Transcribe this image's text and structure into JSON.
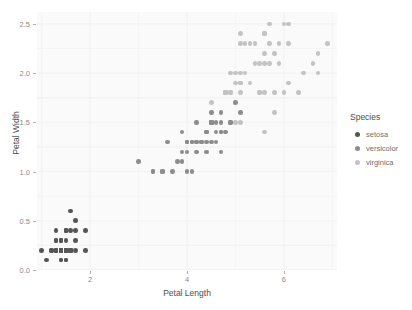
{
  "chart_data": {
    "type": "scatter",
    "title": "",
    "xlabel": "Petal Length",
    "ylabel": "Petal Width",
    "xlim": [
      0.905,
      7.095
    ],
    "ylim": [
      0.0,
      2.62
    ],
    "xticks": [
      2,
      4,
      6
    ],
    "xtick_labels": [
      "2",
      "4",
      "6"
    ],
    "yticks": [
      0.0,
      0.5,
      1.0,
      1.5,
      2.0,
      2.5
    ],
    "ytick_labels": [
      "0.0",
      "0.5",
      "1.0",
      "1.5",
      "2.0",
      "2.5"
    ],
    "grid": true,
    "legend": {
      "title": "Species",
      "position": "right",
      "entries": [
        {
          "name": "setosa",
          "color": "#555555"
        },
        {
          "name": "versicolor",
          "color": "#8c8c8c"
        },
        {
          "name": "virginica",
          "color": "#c3c3c3"
        }
      ]
    },
    "series": [
      {
        "name": "setosa",
        "color": "#555555",
        "points": [
          [
            1.4,
            0.2
          ],
          [
            1.4,
            0.2
          ],
          [
            1.3,
            0.2
          ],
          [
            1.5,
            0.2
          ],
          [
            1.4,
            0.2
          ],
          [
            1.7,
            0.4
          ],
          [
            1.4,
            0.3
          ],
          [
            1.5,
            0.2
          ],
          [
            1.4,
            0.2
          ],
          [
            1.5,
            0.1
          ],
          [
            1.5,
            0.2
          ],
          [
            1.6,
            0.2
          ],
          [
            1.4,
            0.1
          ],
          [
            1.1,
            0.1
          ],
          [
            1.2,
            0.2
          ],
          [
            1.5,
            0.4
          ],
          [
            1.3,
            0.4
          ],
          [
            1.4,
            0.3
          ],
          [
            1.7,
            0.3
          ],
          [
            1.5,
            0.3
          ],
          [
            1.7,
            0.2
          ],
          [
            1.5,
            0.4
          ],
          [
            1.0,
            0.2
          ],
          [
            1.7,
            0.5
          ],
          [
            1.9,
            0.2
          ],
          [
            1.6,
            0.2
          ],
          [
            1.6,
            0.4
          ],
          [
            1.5,
            0.2
          ],
          [
            1.4,
            0.2
          ],
          [
            1.6,
            0.2
          ],
          [
            1.6,
            0.2
          ],
          [
            1.5,
            0.4
          ],
          [
            1.5,
            0.1
          ],
          [
            1.4,
            0.2
          ],
          [
            1.5,
            0.2
          ],
          [
            1.2,
            0.2
          ],
          [
            1.3,
            0.2
          ],
          [
            1.4,
            0.1
          ],
          [
            1.3,
            0.2
          ],
          [
            1.5,
            0.2
          ],
          [
            1.3,
            0.3
          ],
          [
            1.3,
            0.3
          ],
          [
            1.3,
            0.2
          ],
          [
            1.6,
            0.6
          ],
          [
            1.9,
            0.4
          ],
          [
            1.4,
            0.3
          ],
          [
            1.6,
            0.2
          ],
          [
            1.4,
            0.2
          ],
          [
            1.5,
            0.2
          ],
          [
            1.4,
            0.2
          ]
        ]
      },
      {
        "name": "versicolor",
        "color": "#8c8c8c",
        "points": [
          [
            4.7,
            1.4
          ],
          [
            4.5,
            1.5
          ],
          [
            4.9,
            1.5
          ],
          [
            4.0,
            1.3
          ],
          [
            4.6,
            1.5
          ],
          [
            4.5,
            1.3
          ],
          [
            4.7,
            1.6
          ],
          [
            3.3,
            1.0
          ],
          [
            4.6,
            1.3
          ],
          [
            3.9,
            1.4
          ],
          [
            3.5,
            1.0
          ],
          [
            4.2,
            1.5
          ],
          [
            4.0,
            1.0
          ],
          [
            4.7,
            1.4
          ],
          [
            3.6,
            1.3
          ],
          [
            4.4,
            1.4
          ],
          [
            4.5,
            1.5
          ],
          [
            4.1,
            1.0
          ],
          [
            4.5,
            1.5
          ],
          [
            3.9,
            1.1
          ],
          [
            4.8,
            1.8
          ],
          [
            4.0,
            1.3
          ],
          [
            4.9,
            1.5
          ],
          [
            4.7,
            1.2
          ],
          [
            4.3,
            1.3
          ],
          [
            4.4,
            1.4
          ],
          [
            4.8,
            1.4
          ],
          [
            5.0,
            1.7
          ],
          [
            4.5,
            1.5
          ],
          [
            3.5,
            1.0
          ],
          [
            3.8,
            1.1
          ],
          [
            3.7,
            1.0
          ],
          [
            3.9,
            1.2
          ],
          [
            5.1,
            1.6
          ],
          [
            4.5,
            1.5
          ],
          [
            4.5,
            1.6
          ],
          [
            4.7,
            1.5
          ],
          [
            4.4,
            1.3
          ],
          [
            4.1,
            1.3
          ],
          [
            4.0,
            1.3
          ],
          [
            4.4,
            1.2
          ],
          [
            4.6,
            1.4
          ],
          [
            4.0,
            1.2
          ],
          [
            3.3,
            1.0
          ],
          [
            4.2,
            1.3
          ],
          [
            4.2,
            1.2
          ],
          [
            4.2,
            1.3
          ],
          [
            4.3,
            1.3
          ],
          [
            3.0,
            1.1
          ],
          [
            4.1,
            1.3
          ]
        ]
      },
      {
        "name": "virginica",
        "color": "#c3c3c3",
        "points": [
          [
            6.0,
            2.5
          ],
          [
            5.1,
            1.9
          ],
          [
            5.9,
            2.1
          ],
          [
            5.6,
            1.8
          ],
          [
            5.8,
            2.2
          ],
          [
            6.6,
            2.1
          ],
          [
            4.5,
            1.7
          ],
          [
            6.3,
            1.8
          ],
          [
            5.8,
            1.8
          ],
          [
            6.1,
            2.5
          ],
          [
            5.1,
            2.0
          ],
          [
            5.3,
            1.9
          ],
          [
            5.5,
            2.1
          ],
          [
            5.0,
            2.0
          ],
          [
            5.1,
            2.4
          ],
          [
            5.3,
            2.3
          ],
          [
            5.5,
            1.8
          ],
          [
            6.7,
            2.2
          ],
          [
            6.9,
            2.3
          ],
          [
            5.0,
            1.5
          ],
          [
            5.7,
            2.3
          ],
          [
            4.9,
            2.0
          ],
          [
            6.7,
            2.0
          ],
          [
            4.9,
            1.8
          ],
          [
            5.7,
            2.1
          ],
          [
            6.0,
            1.8
          ],
          [
            4.8,
            1.8
          ],
          [
            4.9,
            1.8
          ],
          [
            5.6,
            2.1
          ],
          [
            5.8,
            1.6
          ],
          [
            6.1,
            1.9
          ],
          [
            6.4,
            2.0
          ],
          [
            5.6,
            2.2
          ],
          [
            5.1,
            1.5
          ],
          [
            5.6,
            1.4
          ],
          [
            6.1,
            2.3
          ],
          [
            5.6,
            2.4
          ],
          [
            5.5,
            1.8
          ],
          [
            4.8,
            1.8
          ],
          [
            5.4,
            2.1
          ],
          [
            5.6,
            2.4
          ],
          [
            5.1,
            2.3
          ],
          [
            5.1,
            1.9
          ],
          [
            5.9,
            2.3
          ],
          [
            5.7,
            2.5
          ],
          [
            5.2,
            2.3
          ],
          [
            5.0,
            1.9
          ],
          [
            5.2,
            2.0
          ],
          [
            5.4,
            2.3
          ],
          [
            5.1,
            1.8
          ]
        ]
      }
    ]
  },
  "panel": {
    "background_color": "#fafafa",
    "grid_color": "#f0f0f0"
  }
}
